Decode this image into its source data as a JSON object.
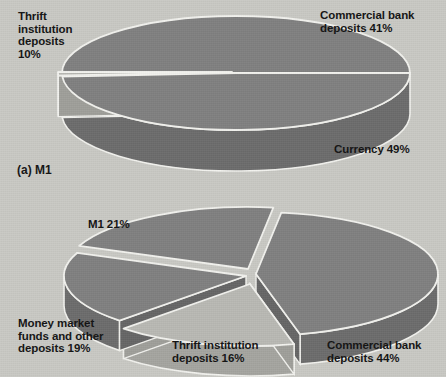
{
  "figure": {
    "background_color": "#c9c9c4",
    "text_color": "#131313"
  },
  "colors": {
    "slice_dark": "#808080",
    "slice_light": "#b9b9b4",
    "slice_dark_side": "#6e6e6e",
    "slice_light_side": "#a3a39e",
    "edge_highlight": "#f2f2ee"
  },
  "charts": [
    {
      "id": "m1-pie",
      "caption": "(a) M1",
      "labels": {
        "thrift": "Thrift\ninstitution\ndeposits\n10%",
        "commercial_bank": "Commercial bank\ndeposits 41%",
        "currency": "Currency 49%"
      }
    },
    {
      "id": "m2-pie",
      "caption": "",
      "labels": {
        "m1": "M1 21%",
        "money_market": "Money market\nfunds and other\ndeposits 19%",
        "thrift": "Thrift institution\ndeposits 16%",
        "commercial_bank": "Commercial bank\ndeposits 44%"
      }
    }
  ],
  "chart_data": [
    {
      "type": "pie",
      "title": "(a) M1",
      "categories": [
        "Currency",
        "Commercial bank deposits",
        "Thrift institution deposits"
      ],
      "values": [
        49,
        41,
        10
      ],
      "labels": [
        "Currency 49%",
        "Commercial bank deposits 41%",
        "Thrift institution deposits 10%"
      ],
      "unit": "percent",
      "exploded": [
        "Thrift institution deposits"
      ],
      "colors": [
        "#808080",
        "#808080",
        "#b9b9b4"
      ],
      "three_d": true,
      "legend": "none",
      "annotations": [
        "Thrift institution deposits 10%",
        "Commercial bank deposits 41%",
        "Currency 49%"
      ]
    },
    {
      "type": "pie",
      "title": "",
      "categories": [
        "Commercial bank deposits",
        "M1",
        "Money market funds and other deposits",
        "Thrift institution deposits"
      ],
      "values": [
        44,
        21,
        19,
        16
      ],
      "labels": [
        "Commercial bank deposits 44%",
        "M1 21%",
        "Money market funds and other deposits 19%",
        "Thrift institution deposits 16%"
      ],
      "unit": "percent",
      "exploded": [
        "M1",
        "Thrift institution deposits"
      ],
      "colors": [
        "#808080",
        "#808080",
        "#808080",
        "#b9b9b4"
      ],
      "three_d": true,
      "legend": "none",
      "annotations": [
        "M1 21%",
        "Money market funds and other deposits 19%",
        "Thrift institution deposits 16%",
        "Commercial bank deposits 44%"
      ]
    }
  ]
}
